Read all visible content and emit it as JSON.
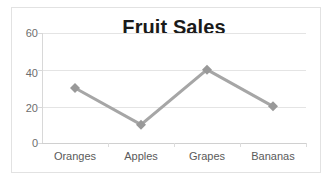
{
  "chart_data": {
    "type": "line",
    "title": "Fruit Sales",
    "xlabel": "",
    "ylabel": "",
    "categories": [
      "Oranges",
      "Apples",
      "Grapes",
      "Bananas"
    ],
    "values": [
      30,
      10,
      40,
      20
    ],
    "series": [
      {
        "name": "Fruit Sales",
        "values": [
          30,
          10,
          40,
          20
        ]
      }
    ],
    "ylim": [
      0,
      60
    ],
    "yticks": [
      0,
      20,
      40,
      60
    ],
    "ytick_labels": [
      "0",
      "20",
      "40",
      "60"
    ],
    "grid": true,
    "legend": false,
    "marker": "diamond",
    "colors": {
      "series_line": "#a6a6a6",
      "marker": "#999999",
      "gridline": "#e4e4e4",
      "axis": "#d8d8d8",
      "title_text": "#1a1a1a",
      "tick_text": "#6d6d6d",
      "category_text": "#5a5a5a",
      "background": "#ffffff",
      "border": "#e2e2e2"
    }
  }
}
